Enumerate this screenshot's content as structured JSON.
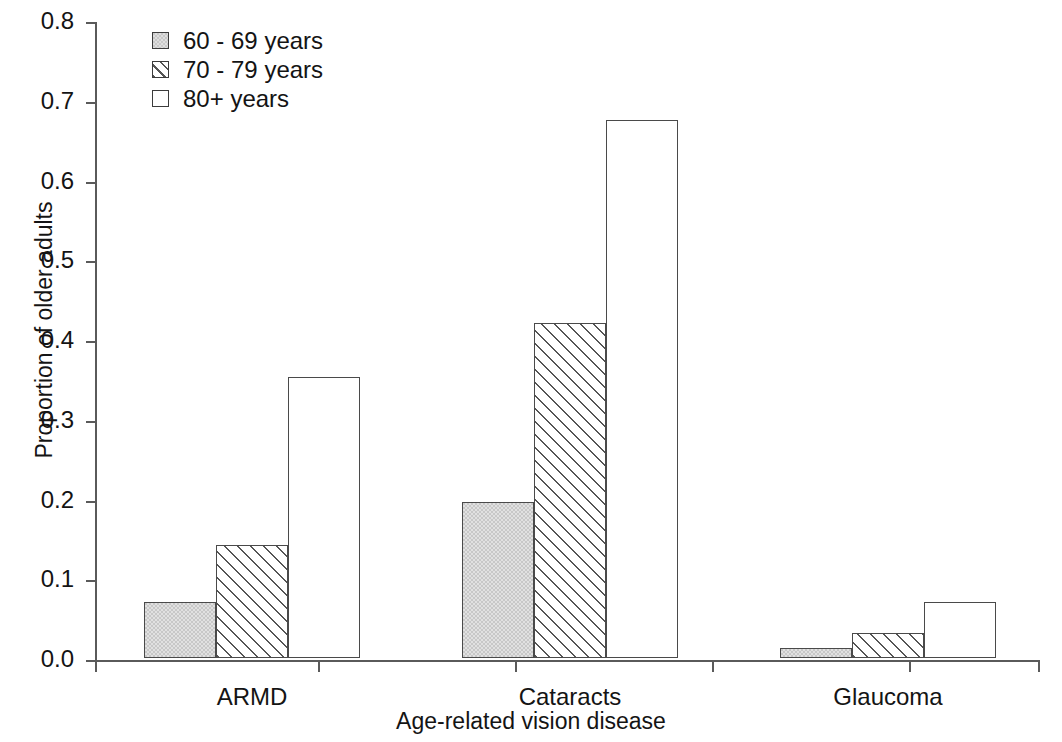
{
  "chart_data": {
    "type": "bar",
    "title": "",
    "xlabel": "Age-related vision disease",
    "ylabel": "Proportion of older adults",
    "categories": [
      "ARMD",
      "Cataracts",
      "Glaucoma"
    ],
    "series": [
      {
        "name": "60 - 69 years",
        "fill": "solid-gray",
        "values": [
          0.07,
          0.196,
          0.0125
        ]
      },
      {
        "name": "70 - 79 years",
        "fill": "hatch",
        "values": [
          0.142,
          0.42,
          0.031
        ]
      },
      {
        "name": "80+ years",
        "fill": "none",
        "values": [
          0.352,
          0.675,
          0.07
        ]
      }
    ],
    "ylim": [
      0.0,
      0.8
    ],
    "ytick_labels": [
      "0.8",
      "0.7",
      "0.6",
      "0.5",
      "0.4",
      "0.3",
      "0.2",
      "0.1",
      "0.0"
    ],
    "ytick_values": [
      0.8,
      0.7,
      0.6,
      0.5,
      0.4,
      0.3,
      0.2,
      0.1,
      0.0
    ],
    "grid": false,
    "legend_position": "top-left",
    "colors": {
      "bar_edge": "#4a4a4a",
      "series_1_fill": "#c8c8c8",
      "series_2_fill": "#ffffff",
      "series_3_fill": "#ffffff",
      "hatch_line": "#555555",
      "axis": "#5a5a5a",
      "text": "#141414",
      "background": "#ffffff"
    }
  },
  "axis": {
    "x_title": "Age-related vision disease",
    "y_title": "Proportion of older adults",
    "y_ticks": [
      {
        "label": "0.8",
        "value": 0.8
      },
      {
        "label": "0.7",
        "value": 0.7
      },
      {
        "label": "0.6",
        "value": 0.6
      },
      {
        "label": "0.5",
        "value": 0.5
      },
      {
        "label": "0.4",
        "value": 0.4
      },
      {
        "label": "0.3",
        "value": 0.3
      },
      {
        "label": "0.2",
        "value": 0.2
      },
      {
        "label": "0.1",
        "value": 0.1
      },
      {
        "label": "0.0",
        "value": 0.0
      }
    ]
  },
  "legend": {
    "items": [
      {
        "label": "60 - 69 years",
        "fill": "solid-gray"
      },
      {
        "label": "70 - 79 years",
        "fill": "hatch"
      },
      {
        "label": "80+ years",
        "fill": "none"
      }
    ]
  }
}
